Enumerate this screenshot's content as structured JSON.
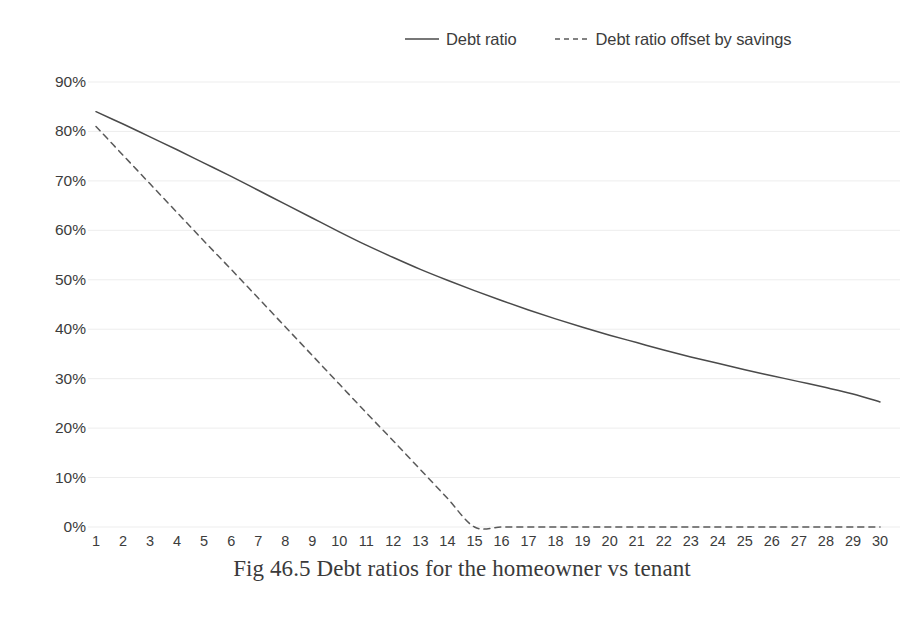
{
  "caption": "Fig 46.5 Debt ratios for the homeowner vs tenant",
  "legend": {
    "entries": [
      {
        "label": "Debt ratio",
        "style": "solid",
        "color": "#4a4a4a",
        "icon": "solid-line-swatch-icon"
      },
      {
        "label": "Debt ratio offset by savings",
        "style": "dashed",
        "color": "#595959",
        "icon": "dashed-line-swatch-icon"
      }
    ]
  },
  "axes": {
    "y_ticks": [
      "0%",
      "10%",
      "20%",
      "30%",
      "40%",
      "50%",
      "60%",
      "70%",
      "80%",
      "90%"
    ],
    "x_ticks": [
      "1",
      "2",
      "3",
      "4",
      "5",
      "6",
      "7",
      "8",
      "9",
      "10",
      "11",
      "12",
      "13",
      "14",
      "15",
      "16",
      "17",
      "18",
      "19",
      "20",
      "21",
      "22",
      "23",
      "24",
      "25",
      "26",
      "27",
      "28",
      "29",
      "30"
    ]
  },
  "colors": {
    "gridline": "#ededed",
    "series_solid": "#4a4a4a",
    "series_dashed": "#595959",
    "text": "#3c3c3c",
    "background": "#ffffff"
  },
  "chart_data": {
    "type": "line",
    "title": "Fig 46.5 Debt ratios for the homeowner vs tenant",
    "xlabel": "",
    "ylabel": "",
    "xlim": [
      1,
      30
    ],
    "ylim": [
      0,
      0.9
    ],
    "y_format": "percent",
    "grid": true,
    "legend_position": "top",
    "x": [
      1,
      2,
      3,
      4,
      5,
      6,
      7,
      8,
      9,
      10,
      11,
      12,
      13,
      14,
      15,
      16,
      17,
      18,
      19,
      20,
      21,
      22,
      23,
      24,
      25,
      26,
      27,
      28,
      29,
      30
    ],
    "series": [
      {
        "name": "Debt ratio",
        "style": "solid",
        "values": [
          0.84,
          0.815,
          0.789,
          0.763,
          0.736,
          0.709,
          0.681,
          0.653,
          0.625,
          0.597,
          0.57,
          0.545,
          0.521,
          0.499,
          0.478,
          0.458,
          0.439,
          0.421,
          0.404,
          0.388,
          0.373,
          0.358,
          0.344,
          0.331,
          0.318,
          0.306,
          0.294,
          0.282,
          0.269,
          0.253
        ]
      },
      {
        "name": "Debt ratio offset by savings",
        "style": "dashed",
        "values": [
          0.81,
          0.752,
          0.694,
          0.636,
          0.578,
          0.521,
          0.463,
          0.405,
          0.347,
          0.289,
          0.231,
          0.174,
          0.116,
          0.058,
          0.0,
          0.0,
          0.0,
          0.0,
          0.0,
          0.0,
          0.0,
          0.0,
          0.0,
          0.0,
          0.0,
          0.0,
          0.0,
          0.0,
          0.0,
          0.0
        ]
      }
    ]
  },
  "plot_geometry": {
    "left": 96,
    "right": 880,
    "y_zero": 527,
    "y_ninety": 82,
    "grid_top": 82
  }
}
